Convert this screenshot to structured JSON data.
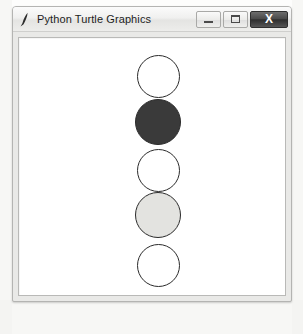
{
  "window": {
    "title": "Python Turtle Graphics",
    "icon": "pen-feather-icon",
    "controls": {
      "minimize": {
        "label": "—",
        "name": "minimize-button"
      },
      "maximize": {
        "label": "☐",
        "name": "maximize-button"
      },
      "close": {
        "label": "X",
        "name": "close-button"
      }
    },
    "colors": {
      "title_bar": "#ededeb",
      "frame": "#e9e9e7",
      "canvas": "#ffffff",
      "close_button": "#2e2e2e"
    }
  },
  "canvas": {
    "name": "turtle-canvas",
    "background": "#ffffff",
    "pen_color": "#2b2b2b",
    "shapes": [
      {
        "shape": "circle",
        "index": 1,
        "fill": "#ffffff",
        "fill_name": "white",
        "cx": 157,
        "cy": 75,
        "radius": 21.5
      },
      {
        "shape": "circle",
        "index": 2,
        "fill": "#3a3a3a",
        "fill_name": "dark gray",
        "cx": 157,
        "cy": 121,
        "radius": 23.0
      },
      {
        "shape": "circle",
        "index": 3,
        "fill": "#ffffff",
        "fill_name": "white",
        "cx": 157,
        "cy": 169,
        "radius": 21.5
      },
      {
        "shape": "circle",
        "index": 4,
        "fill": "#e3e3e0",
        "fill_name": "light gray",
        "cx": 157,
        "cy": 214,
        "radius": 23.0
      },
      {
        "shape": "circle",
        "index": 5,
        "fill": "#ffffff",
        "fill_name": "white",
        "cx": 157,
        "cy": 264,
        "radius": 21.5
      }
    ]
  }
}
